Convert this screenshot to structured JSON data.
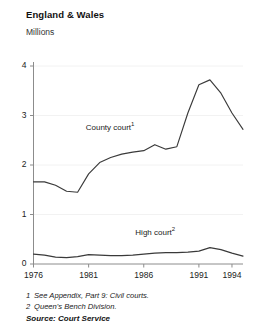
{
  "header": {
    "title": "England & Wales",
    "unit_label": "Millions"
  },
  "footnotes": [
    {
      "marker": "1",
      "text": "See Appendix, Part 9: Civil courts."
    },
    {
      "marker": "2",
      "text": "Queen's Bench Division."
    }
  ],
  "source": "Source: Court Service",
  "colors": {
    "line": "#3a3a3a",
    "axis": "#8c8c8c",
    "grid": "#f2f2f2",
    "text": "#222222"
  },
  "chart_data": {
    "type": "line",
    "title": "England & Wales",
    "subtitle": "Millions",
    "xlabel": "",
    "ylabel": "Millions",
    "xlim": [
      1976,
      1995
    ],
    "ylim": [
      0,
      4
    ],
    "yticks": [
      0,
      1,
      2,
      3,
      4
    ],
    "ytick_labels": [
      "0",
      "1",
      "2",
      "3",
      "4"
    ],
    "xticks": [
      1976,
      1981,
      1986,
      1991,
      1994
    ],
    "xtick_labels": [
      "1976",
      "1981",
      "1986",
      "1991",
      "1994"
    ],
    "grid": true,
    "legend": "inline-annotations",
    "annotations": [
      {
        "label": "County court",
        "marker": "1",
        "x": 1984,
        "y": 2.75
      },
      {
        "label": "High court",
        "marker": "2",
        "x": 1988.5,
        "y": 0.62
      }
    ],
    "x": [
      1976,
      1977,
      1978,
      1979,
      1980,
      1981,
      1982,
      1983,
      1984,
      1985,
      1986,
      1987,
      1988,
      1989,
      1990,
      1991,
      1992,
      1993,
      1994,
      1995
    ],
    "series": [
      {
        "name": "County court",
        "footnote": "1",
        "values": [
          1.66,
          1.66,
          1.59,
          1.47,
          1.45,
          1.82,
          2.05,
          2.15,
          2.22,
          2.26,
          2.29,
          2.41,
          2.32,
          2.37,
          3.05,
          3.62,
          3.72,
          3.45,
          3.05,
          2.72
        ]
      },
      {
        "name": "High court",
        "footnote": "2",
        "values": [
          0.2,
          0.18,
          0.14,
          0.13,
          0.15,
          0.19,
          0.18,
          0.17,
          0.17,
          0.18,
          0.2,
          0.22,
          0.23,
          0.23,
          0.24,
          0.26,
          0.33,
          0.29,
          0.22,
          0.16
        ]
      }
    ]
  }
}
